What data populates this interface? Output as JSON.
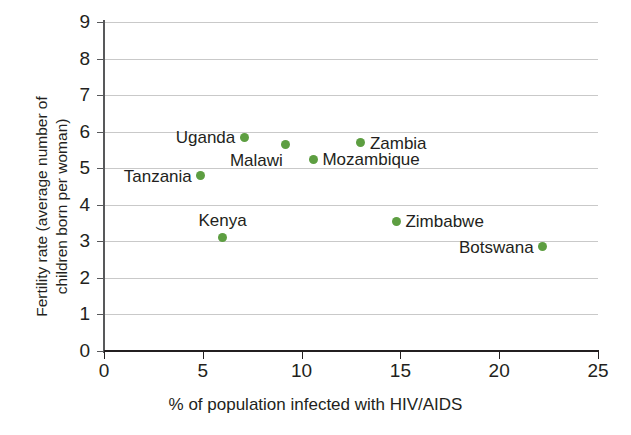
{
  "chart_data": {
    "type": "scatter",
    "title": "",
    "xlabel": "% of population infected with HIV/AIDS",
    "ylabel": "Fertility rate (average number of\nchildren born per woman)",
    "xlim": [
      0,
      25
    ],
    "ylim": [
      0,
      9
    ],
    "xticks": [
      "0",
      "5",
      "10",
      "15",
      "20",
      "25"
    ],
    "xtick_values": [
      0,
      5,
      10,
      15,
      20,
      25
    ],
    "yticks": [
      "0",
      "1",
      "2",
      "3",
      "4",
      "5",
      "6",
      "7",
      "8",
      "9"
    ],
    "ytick_values": [
      0,
      1,
      2,
      3,
      4,
      5,
      6,
      7,
      8,
      9
    ],
    "grid": "horizontal",
    "legend": "none",
    "marker_color": "#5d9e41",
    "points": [
      {
        "label": "Tanzania",
        "x": 4.9,
        "y": 4.8,
        "label_side": "left"
      },
      {
        "label": "Kenya",
        "x": 6.0,
        "y": 3.1,
        "label_side": "above"
      },
      {
        "label": "Uganda",
        "x": 7.1,
        "y": 5.85,
        "label_side": "left"
      },
      {
        "label": "Malawi",
        "x": 9.2,
        "y": 5.65,
        "label_side": "below-left"
      },
      {
        "label": "Mozambique",
        "x": 10.6,
        "y": 5.25,
        "label_side": "right"
      },
      {
        "label": "Zambia",
        "x": 13.0,
        "y": 5.7,
        "label_side": "right"
      },
      {
        "label": "Zimbabwe",
        "x": 14.8,
        "y": 3.55,
        "label_side": "right"
      },
      {
        "label": "Botswana",
        "x": 22.2,
        "y": 2.85,
        "label_side": "left"
      }
    ]
  }
}
